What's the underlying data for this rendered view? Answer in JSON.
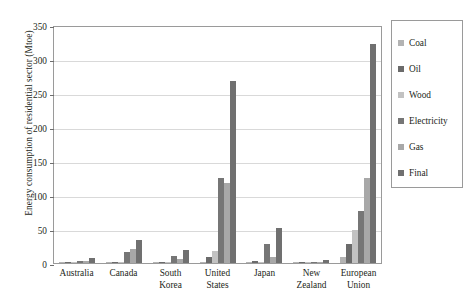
{
  "chart_data": {
    "type": "bar",
    "title": "",
    "xlabel": "",
    "ylabel": "Energy consumption of residential sector (Mtoe)",
    "ylim": [
      0,
      350
    ],
    "yticks": [
      0,
      50,
      100,
      150,
      200,
      250,
      300,
      350
    ],
    "grid": true,
    "legend_position": "right",
    "categories": [
      "Australia",
      "Canada",
      "South\nKorea",
      "United\nStates",
      "Japan",
      "New\nZealand",
      "European\nUnion"
    ],
    "series": [
      {
        "name": "Coal",
        "color": "#b3b3b3",
        "values": [
          0.2,
          0.3,
          1.5,
          1.0,
          0.3,
          0.1,
          9.0
        ]
      },
      {
        "name": "Oil",
        "color": "#6b6b6b",
        "values": [
          0.6,
          1.2,
          2.0,
          9.0,
          3.0,
          0.5,
          28.0
        ]
      },
      {
        "name": "Wood",
        "color": "#c2c2c2",
        "values": [
          1.4,
          1.4,
          0.8,
          17.0,
          0.6,
          1.0,
          48.0
        ]
      },
      {
        "name": "Electricity",
        "color": "#767676",
        "values": [
          3.2,
          16.0,
          11.0,
          125.0,
          28.0,
          2.2,
          76.0
        ]
      },
      {
        "name": "Gas",
        "color": "#a8a8a8",
        "values": [
          2.6,
          21.0,
          6.0,
          118.0,
          9.0,
          1.2,
          125.0
        ]
      },
      {
        "name": "Final",
        "color": "#707070",
        "values": [
          6.8,
          34.0,
          19.0,
          268.0,
          52.0,
          4.0,
          322.0
        ]
      }
    ]
  },
  "axis": {
    "tick_labels": [
      "0",
      "50",
      "100",
      "150",
      "200",
      "250",
      "300",
      "350"
    ]
  },
  "legend": {
    "items": [
      {
        "label": "Coal"
      },
      {
        "label": "Oil"
      },
      {
        "label": "Wood"
      },
      {
        "label": "Electricity"
      },
      {
        "label": "Gas"
      },
      {
        "label": "Final"
      }
    ]
  }
}
